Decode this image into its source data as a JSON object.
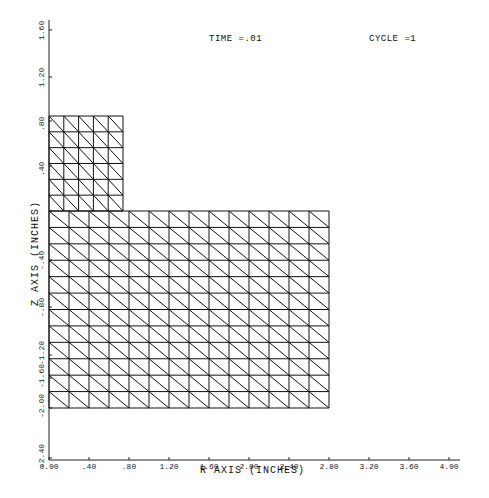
{
  "header": {
    "time_label": "TIME =.01",
    "cycle_label": "CYCLE =1"
  },
  "axes": {
    "x_label": "R AXIS (INCHES)",
    "y_label": "Z AXIS (INCHES)",
    "x_ticks": [
      "0.00",
      ".40",
      ".80",
      "1.20",
      "1.60",
      "2.00",
      "2.40",
      "2.80",
      "3.20",
      "3.60",
      "4.00"
    ],
    "y_ticks": [
      "1.60",
      "1.20",
      ".80",
      ".40",
      "0",
      "-.40",
      "-.80",
      "-1.20",
      "-1.60",
      "-2.00",
      "-2.40"
    ]
  },
  "chart_data": {
    "type": "mesh",
    "xlabel": "R AXIS (INCHES)",
    "ylabel": "Z AXIS (INCHES)",
    "xlim": [
      0.0,
      4.0
    ],
    "ylim": [
      -2.4,
      1.6
    ],
    "x_tick_labels": [
      "0.00",
      ".40",
      ".80",
      "1.20",
      "1.60",
      "2.00",
      "2.40",
      "2.80",
      "3.20",
      "3.60",
      "4.00"
    ],
    "y_tick_labels": [
      "1.60",
      "1.20",
      ".80",
      ".40",
      "0",
      "-.40",
      "-.80",
      "-1.20",
      "-1.60",
      "-2.00",
      "-2.40"
    ],
    "grid": false,
    "regions": [
      {
        "name": "upper-block",
        "r_range": [
          0.0,
          0.74
        ],
        "z_range": [
          0.0,
          0.8
        ],
        "cols": 5,
        "rows": 6,
        "element": "triangle",
        "diagonal": "top-left to bottom-right"
      },
      {
        "name": "lower-block",
        "r_range": [
          0.0,
          2.8
        ],
        "z_range": [
          -2.0,
          0.0
        ],
        "cols": 14,
        "rows": 12,
        "element": "triangle",
        "diagonal": "top-left to bottom-right"
      }
    ],
    "line_color": "#111111"
  },
  "colors": {
    "background": "#ffffff",
    "ink": "#111111"
  }
}
